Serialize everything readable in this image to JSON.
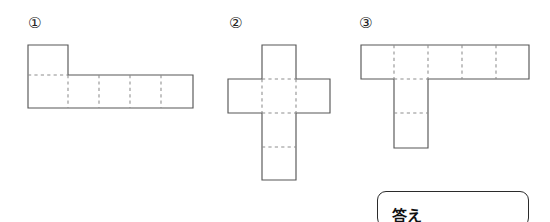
{
  "page": {
    "background": "#ffffff",
    "width": 550,
    "height": 222,
    "line_color": "#575757",
    "fold_color": "#8d8d8d"
  },
  "nets": [
    {
      "label": "①",
      "shape": "L-shaped net",
      "squares": 6,
      "cell_size": 33,
      "label_pos": {
        "x": 28,
        "y": 16
      },
      "outline": "M28,45 L68,45 L68,75 L193,75 L193,108 L28,108 Z",
      "fold_lines": [
        "M28,75 L68,75",
        "M68,75 L68,108",
        "M99,75 L99,108",
        "M130,75 L130,108",
        "M161,75 L161,108"
      ]
    },
    {
      "label": "②",
      "shape": "cross-shaped net",
      "squares": 6,
      "cell_size": 34,
      "label_pos": {
        "x": 229,
        "y": 16
      },
      "outline": "M262,45 L296,45 L296,79 L330,79 L330,113 L296,113 L296,180 L262,180 L262,113 L228,113 L228,79 L262,79 Z",
      "fold_lines": [
        "M262,79 L296,79",
        "M262,113 L296,113",
        "M262,79 L262,113",
        "M296,79 L296,113",
        "M262,147 L296,147"
      ]
    },
    {
      "label": "③",
      "shape": "T-shaped net",
      "squares": 7,
      "cell_size": 34,
      "label_pos": {
        "x": 359,
        "y": 16
      },
      "outline": "M361,45 L529,45 L529,79 L428,79 L428,148 L394,148 L394,79 L361,79 Z",
      "fold_lines": [
        "M394,79 L428,79",
        "M394,45 L394,79",
        "M428,45 L428,79",
        "M462,45 L462,79",
        "M496,45 L496,79",
        "M394,113 L428,113"
      ]
    }
  ],
  "answer": {
    "label": "答え",
    "box": {
      "x": 377,
      "y": 191,
      "width": 152,
      "height": 36
    },
    "label_pos": {
      "x": 392,
      "y": 209
    }
  }
}
